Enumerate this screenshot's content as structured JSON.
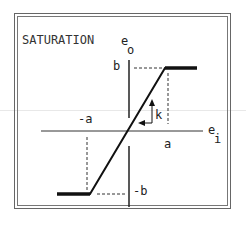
{
  "diagram": {
    "title": "SATURATION",
    "output_axis_label": "e",
    "output_axis_subscript": "o",
    "input_axis_label": "e",
    "input_axis_subscript": "i",
    "labels": {
      "b": "b",
      "neg_b": "-b",
      "a": "a",
      "neg_a": "-a",
      "slope": "k"
    },
    "colors": {
      "line": "#111111",
      "frame": "#666666"
    }
  }
}
